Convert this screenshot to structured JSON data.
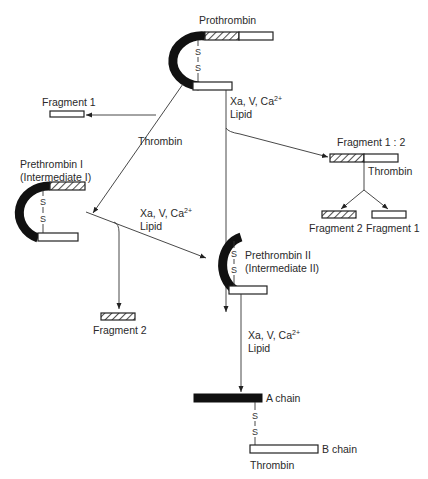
{
  "diagram": {
    "type": "reaction-pathway",
    "nodes": {
      "prothrombin": {
        "label": "Prothrombin"
      },
      "fragment1_top": {
        "label": "Fragment 1"
      },
      "prethrombin1": {
        "label_line1": "Prethrombin I",
        "label_line2": "(Intermediate I)"
      },
      "fragment12": {
        "label": "Fragment 1 : 2"
      },
      "fragment2_right": {
        "label": "Fragment 2"
      },
      "fragment1_right": {
        "label": "Fragment 1"
      },
      "prethrombin2": {
        "label_line1": "Prethrombin II",
        "label_line2": "(Intermediate II)"
      },
      "fragment2_left": {
        "label": "Fragment 2"
      },
      "a_chain": {
        "label": "A chain"
      },
      "b_chain": {
        "label": "B chain"
      },
      "thrombin": {
        "label": "Thrombin"
      }
    },
    "edges": [
      {
        "from": "prothrombin",
        "to": [
          "fragment1_top",
          "prethrombin1"
        ],
        "label": "Thrombin"
      },
      {
        "from": "prothrombin",
        "to": [
          "fragment12",
          "prethrombin2"
        ],
        "label_line1": "Xa, V, Ca",
        "label_sup": "2+",
        "label_line2": "Lipid"
      },
      {
        "from": "fragment12",
        "to": [
          "fragment2_right",
          "fragment1_right"
        ],
        "label": "Thrombin"
      },
      {
        "from": "prethrombin1",
        "to": [
          "fragment2_left",
          "prethrombin2"
        ],
        "label_line1": "Xa, V, Ca",
        "label_sup": "2+",
        "label_line2": "Lipid"
      },
      {
        "from": "prethrombin2",
        "to": [
          "thrombin"
        ],
        "label_line1": "Xa, V, Ca",
        "label_sup": "2+",
        "label_line2": "Lipid"
      }
    ],
    "disulfide": "S",
    "legend": {}
  }
}
